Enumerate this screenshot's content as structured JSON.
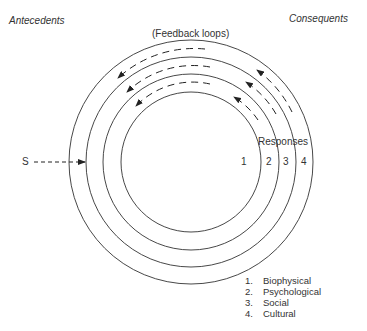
{
  "labels": {
    "antecedents": "Antecedents",
    "consequents": "Consequents",
    "feedback": "(Feedback loops)",
    "stimulus": "S",
    "responses": "Responses"
  },
  "rings": [
    {
      "number": "1",
      "radius": 70
    },
    {
      "number": "2",
      "radius": 88
    },
    {
      "number": "3",
      "radius": 105
    },
    {
      "number": "4",
      "radius": 122
    }
  ],
  "legend": [
    {
      "num": "1.",
      "label": "Biophysical"
    },
    {
      "num": "2.",
      "label": "Psychological"
    },
    {
      "num": "3.",
      "label": "Social"
    },
    {
      "num": "4.",
      "label": "Cultural"
    }
  ],
  "colors": {
    "stroke": "#333333",
    "background": "#ffffff"
  }
}
